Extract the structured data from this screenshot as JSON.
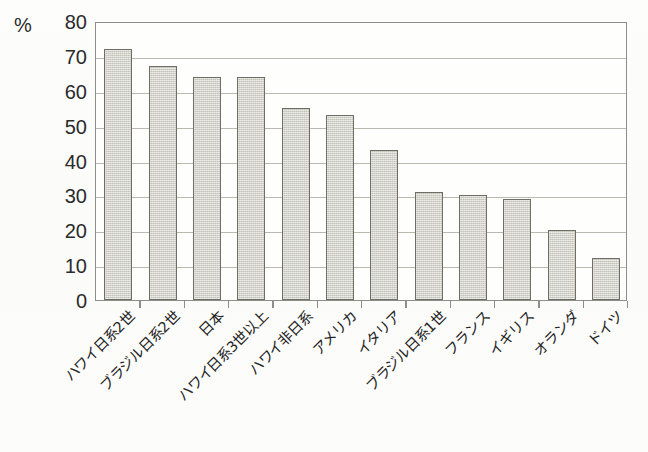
{
  "chart_data": {
    "type": "bar",
    "title": "",
    "xlabel": "",
    "ylabel": "%",
    "unit_label": "%",
    "ylim": [
      0,
      80
    ],
    "ytick_step": 10,
    "yticks": [
      80,
      70,
      60,
      50,
      40,
      30,
      20,
      10,
      0
    ],
    "grid": true,
    "legend": "none",
    "categories": [
      "ハワイ日系2世",
      "ブラジル日系2世",
      "日本",
      "ハワイ日系3世以上",
      "ハワイ非日系",
      "アメリカ",
      "イタリア",
      "ブラジル日系1世",
      "フランス",
      "イギリス",
      "オランダ",
      "ドイツ"
    ],
    "values": [
      72,
      67,
      64,
      64,
      55,
      53,
      43,
      31,
      30,
      29,
      20,
      12
    ]
  },
  "style": {
    "bar_fill": "#cdcdc4",
    "bar_border": "#6e6e66",
    "gridline_color": "#b9b9b0",
    "axis_color": "#8e8e88",
    "text_color": "#232323",
    "background": "#fdfdfb"
  }
}
